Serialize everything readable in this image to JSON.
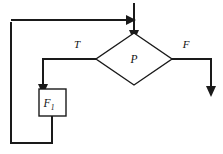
{
  "figure": {
    "kind": "flowchart",
    "background_color": "#ffffff",
    "line_color": "#1a1a1a"
  },
  "nodes": {
    "decision": {
      "id": "decision-p",
      "shape": "diamond",
      "label": "P",
      "center_x": 134,
      "center_y": 59,
      "half_width": 38,
      "half_height": 26
    },
    "process": {
      "id": "process-f1",
      "shape": "rectangle",
      "label": "F",
      "subscript": "1",
      "x": 39,
      "y": 89,
      "width": 27,
      "height": 27
    }
  },
  "edges": {
    "true_branch": {
      "label": "T",
      "label_x": 77,
      "label_y": 48
    },
    "false_branch": {
      "label": "F",
      "label_x": 186,
      "label_y": 48
    },
    "entry": {
      "label": ""
    },
    "feedback": {
      "label": ""
    }
  },
  "geometry": {
    "entry_line": "M 134 3 L 134 30",
    "merge_line": "M 11 20 L 126 20",
    "true_line": "M 96 59 L 43 59 L 43 84",
    "false_line": "M 172 59 L 211 59 L 211 86",
    "loop_line": "M 52 116 L 52 143 L 11 143 L 11 22",
    "diamond_points": "134,33 172,59 134,85 96,59",
    "arrow_entry": "129,30 139,30 134,41",
    "arrow_merge": "126,15 136,20 126,25",
    "arrow_true": "38,84 48,84 43,95",
    "arrow_false": "206,86 216,86 211,97"
  }
}
